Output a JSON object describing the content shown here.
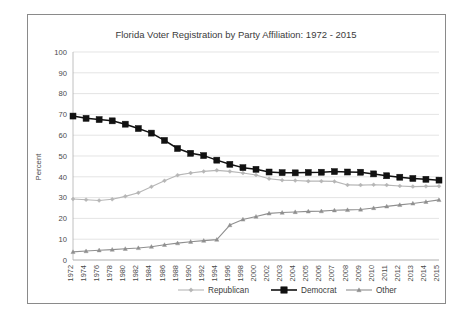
{
  "chart_data": {
    "type": "line",
    "title": "Florida Voter Registration by Party Affiliation: 1972 - 2015",
    "xlabel": "",
    "ylabel": "Percent",
    "ylim": [
      0,
      100
    ],
    "ytick_values": [
      0,
      10,
      20,
      30,
      40,
      50,
      60,
      70,
      80,
      90,
      100
    ],
    "ytick_labels": [
      "0",
      "10",
      "20",
      "30",
      "40",
      "50",
      "60",
      "70",
      "80",
      "90",
      "100"
    ],
    "grid": true,
    "legend_position": "bottom",
    "categories": [
      "1972",
      "1974",
      "1976",
      "1978",
      "1980",
      "1982",
      "1984",
      "1986",
      "1988",
      "1990",
      "1992",
      "1994",
      "1996",
      "1998",
      "2000",
      "2002",
      "2003",
      "2004",
      "2005",
      "2006",
      "2007",
      "2008",
      "2009",
      "2010",
      "2011",
      "2012",
      "2013",
      "2014",
      "2015"
    ],
    "series": [
      {
        "name": "Republican",
        "color": "#b6b6b6",
        "marker": "diamond",
        "values": [
          29.3,
          29.0,
          28.6,
          29.2,
          30.6,
          32.3,
          35.2,
          38.1,
          40.8,
          41.8,
          42.6,
          43.1,
          42.6,
          41.8,
          40.9,
          39.1,
          38.4,
          38.2,
          37.9,
          37.9,
          37.8,
          36.1,
          36.0,
          36.2,
          36.0,
          35.6,
          35.3,
          35.4,
          35.5
        ]
      },
      {
        "name": "Democrat",
        "color": "#111111",
        "marker": "square",
        "values": [
          69.2,
          68.1,
          67.5,
          66.9,
          65.3,
          63.2,
          61.0,
          57.5,
          53.6,
          51.3,
          50.2,
          48.0,
          46.0,
          44.4,
          43.6,
          42.3,
          42.0,
          41.9,
          42.1,
          42.2,
          42.5,
          42.3,
          42.2,
          41.4,
          40.5,
          39.8,
          39.2,
          38.8,
          38.4
        ]
      },
      {
        "name": "Other",
        "color": "#8f8f8f",
        "marker": "triangle",
        "values": [
          3.9,
          4.3,
          4.7,
          5.0,
          5.4,
          5.8,
          6.4,
          7.3,
          8.1,
          8.8,
          9.3,
          9.8,
          16.8,
          19.5,
          20.9,
          22.4,
          22.8,
          23.1,
          23.4,
          23.5,
          23.9,
          24.1,
          24.3,
          25.0,
          25.8,
          26.5,
          27.2,
          28.0,
          28.9
        ]
      }
    ],
    "legend": [
      {
        "label": "Republican",
        "color": "#b6b6b6",
        "marker": "diamond"
      },
      {
        "label": "Democrat",
        "color": "#111111",
        "marker": "square"
      },
      {
        "label": "Other",
        "color": "#8f8f8f",
        "marker": "triangle"
      }
    ]
  }
}
